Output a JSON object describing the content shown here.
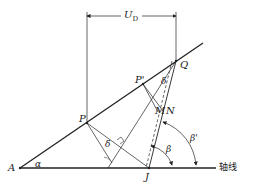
{
  "diagram": {
    "type": "geometry",
    "points": {
      "A": {
        "label": "A"
      },
      "P": {
        "label": "P"
      },
      "P_prime": {
        "label": "P'"
      },
      "Q": {
        "label": "Q"
      },
      "M": {
        "label": "M"
      },
      "N": {
        "label": "N"
      },
      "J": {
        "label": "J"
      }
    },
    "angles": {
      "alpha": "α",
      "delta_lower": "δ",
      "delta_upper": "δ",
      "beta": "β",
      "beta_prime": "β'"
    },
    "dimension": {
      "label_main": "U",
      "label_sub": "D"
    },
    "axis_label": "轴线",
    "colors": {
      "stroke": "#222222",
      "background": "#ffffff"
    }
  }
}
